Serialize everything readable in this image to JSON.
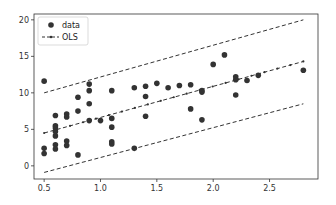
{
  "chart_data": {
    "type": "scatter",
    "title": "",
    "xlabel": "",
    "ylabel": "",
    "xlim": [
      0.41,
      2.93
    ],
    "ylim": [
      -1.8,
      20.8
    ],
    "xticks": [
      0.5,
      1.0,
      1.5,
      2.0,
      2.5
    ],
    "xtick_labels": [
      "0.5",
      "1.0",
      "1.5",
      "2.0",
      "2.5"
    ],
    "yticks": [
      0,
      5,
      10,
      15,
      20
    ],
    "ytick_labels": [
      "0",
      "5",
      "10",
      "15",
      "20"
    ],
    "grid": false,
    "legend": {
      "position": "upper left",
      "entries": [
        "data",
        "OLS"
      ]
    },
    "series": [
      {
        "name": "data",
        "kind": "scatter",
        "color": "#333333",
        "points": [
          [
            0.5,
            11.6
          ],
          [
            0.5,
            2.4
          ],
          [
            0.5,
            1.7
          ],
          [
            0.6,
            6.9
          ],
          [
            0.6,
            5.5
          ],
          [
            0.6,
            5.2
          ],
          [
            0.6,
            4.7
          ],
          [
            0.6,
            4.1
          ],
          [
            0.6,
            2.9
          ],
          [
            0.6,
            2.3
          ],
          [
            0.7,
            7.1
          ],
          [
            0.7,
            6.7
          ],
          [
            0.7,
            3.4
          ],
          [
            0.7,
            2.8
          ],
          [
            0.8,
            9.4
          ],
          [
            0.8,
            7.5
          ],
          [
            0.8,
            1.5
          ],
          [
            0.9,
            11.2
          ],
          [
            0.9,
            10.3
          ],
          [
            0.9,
            8.5
          ],
          [
            0.9,
            6.2
          ],
          [
            1.0,
            6.2
          ],
          [
            1.1,
            10.3
          ],
          [
            1.1,
            6.5
          ],
          [
            1.1,
            5.3
          ],
          [
            1.1,
            3.3
          ],
          [
            1.1,
            3.0
          ],
          [
            1.3,
            10.7
          ],
          [
            1.3,
            2.4
          ],
          [
            1.4,
            10.9
          ],
          [
            1.4,
            9.5
          ],
          [
            1.4,
            6.8
          ],
          [
            1.5,
            11.3
          ],
          [
            1.6,
            10.7
          ],
          [
            1.7,
            11.0
          ],
          [
            1.8,
            11.1
          ],
          [
            1.8,
            7.8
          ],
          [
            1.9,
            10.3
          ],
          [
            1.9,
            10.1
          ],
          [
            1.9,
            6.3
          ],
          [
            2.0,
            13.9
          ],
          [
            2.1,
            15.2
          ],
          [
            2.2,
            12.2
          ],
          [
            2.2,
            11.8
          ],
          [
            2.2,
            9.7
          ],
          [
            2.3,
            11.7
          ],
          [
            2.4,
            12.4
          ],
          [
            2.8,
            13.1
          ]
        ]
      },
      {
        "name": "OLS",
        "kind": "line",
        "style": "dashed-with-dots",
        "color": "#333333",
        "x": [
          0.5,
          2.8
        ],
        "values": [
          4.5,
          14.3
        ]
      },
      {
        "name": "upper bound",
        "kind": "line",
        "style": "dashed",
        "color": "#333333",
        "x": [
          0.5,
          2.8
        ],
        "values": [
          10.0,
          20.0
        ]
      },
      {
        "name": "lower bound",
        "kind": "line",
        "style": "dashed",
        "color": "#333333",
        "x": [
          0.5,
          2.8
        ],
        "values": [
          -0.9,
          8.5
        ]
      }
    ]
  }
}
